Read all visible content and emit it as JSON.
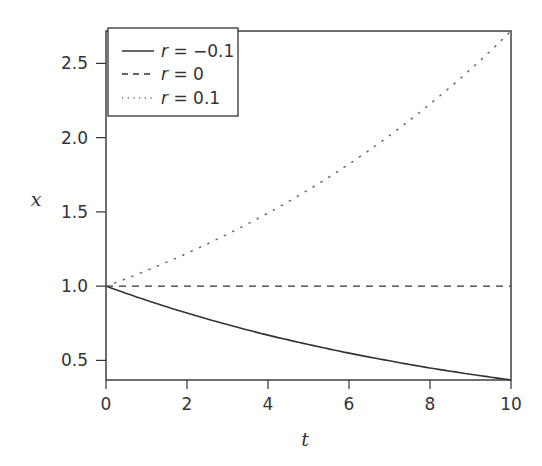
{
  "chart_data": {
    "type": "line",
    "title": "",
    "xlabel": "t",
    "ylabel": "x",
    "xlim": [
      0,
      10
    ],
    "ylim": [
      0.368,
      2.718
    ],
    "xticks": [
      0,
      2,
      4,
      6,
      8,
      10
    ],
    "xtick_labels": [
      "0",
      "2",
      "4",
      "6",
      "8",
      "10"
    ],
    "yticks": [
      0.5,
      1.0,
      1.5,
      2.0,
      2.5
    ],
    "ytick_labels": [
      "0.5",
      "1.0",
      "1.5",
      "2.0",
      "2.5"
    ],
    "grid": false,
    "legend_position": "upper left",
    "x": [
      0,
      1,
      2,
      3,
      4,
      5,
      6,
      7,
      8,
      9,
      10
    ],
    "series": [
      {
        "name": "r = −0.1",
        "style": "solid",
        "values": [
          1.0,
          0.905,
          0.819,
          0.741,
          0.67,
          0.607,
          0.549,
          0.497,
          0.449,
          0.407,
          0.368
        ]
      },
      {
        "name": "r = 0",
        "style": "dashed",
        "values": [
          1.0,
          1.0,
          1.0,
          1.0,
          1.0,
          1.0,
          1.0,
          1.0,
          1.0,
          1.0,
          1.0
        ]
      },
      {
        "name": "r = 0.1",
        "style": "dotted",
        "values": [
          1.0,
          1.105,
          1.221,
          1.35,
          1.492,
          1.649,
          1.822,
          2.014,
          2.226,
          2.46,
          2.718
        ]
      }
    ]
  },
  "legend": {
    "items": [
      {
        "var": "r",
        "eq": " = ",
        "value": "−0.1"
      },
      {
        "var": "r",
        "eq": " = ",
        "value": "0"
      },
      {
        "var": "r",
        "eq": " = ",
        "value": "0.1"
      }
    ]
  },
  "axes": {
    "xlabel": "t",
    "ylabel": "x"
  }
}
